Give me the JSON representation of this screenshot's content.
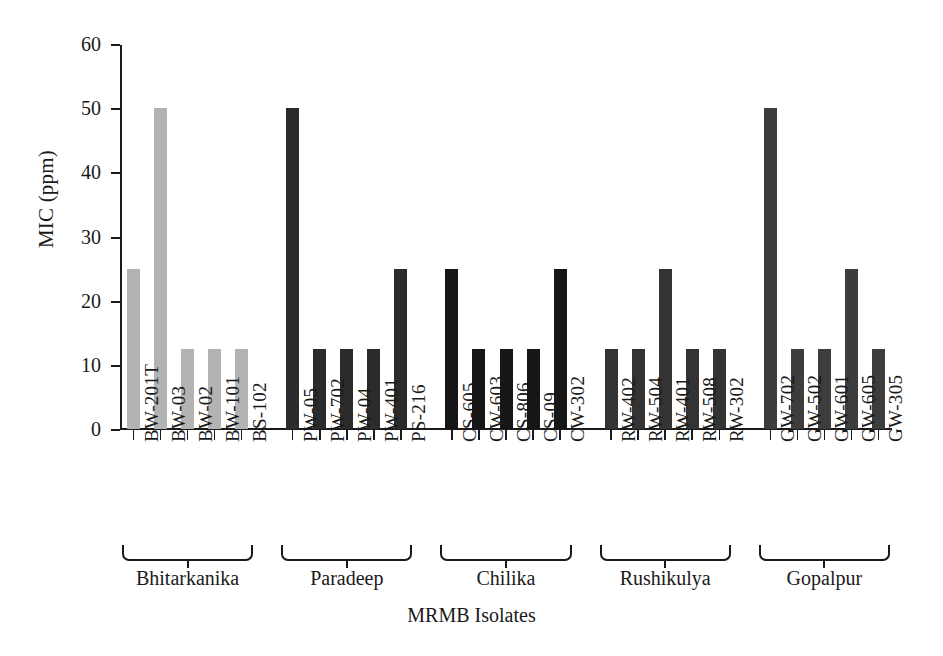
{
  "chart_data": {
    "type": "bar",
    "title": "",
    "xlabel": "MRMB Isolates",
    "ylabel": "MIC (ppm)",
    "ylim": [
      0,
      60
    ],
    "yticks": [
      0,
      10,
      20,
      30,
      40,
      50,
      60
    ],
    "grid": false,
    "legend": "none",
    "categories": [
      "BW-201T",
      "BW-03",
      "BW-02",
      "BW-101",
      "BS-102",
      "PW-05",
      "PW-702",
      "PW-04",
      "PW-401",
      "PS-216",
      "CS-605",
      "CW-603",
      "CS-806",
      "CS-09",
      "CW-302",
      "RW-402",
      "RW-504",
      "RW-401",
      "RW-508",
      "RW-302",
      "GW-702",
      "GW-502",
      "GW-601",
      "GW-605",
      "GW-305"
    ],
    "values": [
      25,
      50,
      12.5,
      12.5,
      12.5,
      50,
      12.5,
      12.5,
      12.5,
      25,
      25,
      12.5,
      12.5,
      12.5,
      25,
      12.5,
      12.5,
      25,
      12.5,
      12.5,
      50,
      12.5,
      12.5,
      25,
      12.5
    ],
    "groups": [
      {
        "name": "Bhitarkanika",
        "start": 0,
        "count": 5,
        "color": "#b3b3b3"
      },
      {
        "name": "Paradeep",
        "start": 5,
        "count": 5,
        "color": "#2b2b2b"
      },
      {
        "name": "Chilika",
        "start": 10,
        "count": 5,
        "color": "#161616"
      },
      {
        "name": "Rushikulya",
        "start": 15,
        "count": 5,
        "color": "#333333"
      },
      {
        "name": "Gopalpur",
        "start": 20,
        "count": 5,
        "color": "#3d3d3d"
      }
    ],
    "bar_colors": [
      "#b3b3b3",
      "#b3b3b3",
      "#b3b3b3",
      "#b3b3b3",
      "#b3b3b3",
      "#2b2b2b",
      "#2b2b2b",
      "#2b2b2b",
      "#2b2b2b",
      "#2b2b2b",
      "#161616",
      "#161616",
      "#161616",
      "#161616",
      "#161616",
      "#333333",
      "#333333",
      "#333333",
      "#333333",
      "#333333",
      "#3d3d3d",
      "#3d3d3d",
      "#3d3d3d",
      "#3d3d3d",
      "#3d3d3d"
    ],
    "axis_color": "#1a1a1a",
    "background": "#ffffff"
  }
}
